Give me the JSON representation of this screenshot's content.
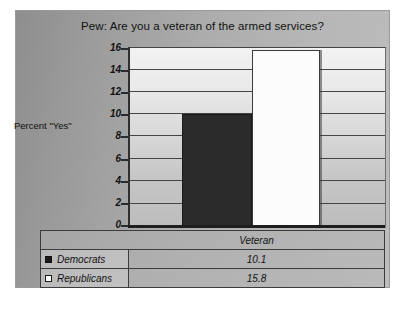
{
  "chart_data": {
    "type": "bar",
    "title": "Pew: Are you a veteran of the armed services?",
    "xlabel": "",
    "ylabel": "Percent \"Yes\"",
    "categories": [
      "Veteran"
    ],
    "series": [
      {
        "name": "Democrats",
        "values": [
          10.1
        ],
        "color": "#2b2b2b"
      },
      {
        "name": "Republicans",
        "values": [
          15.8
        ],
        "color": "#fcfcfc"
      }
    ],
    "ylim": [
      0,
      16
    ],
    "ytick_step": 2,
    "yticks": [
      "0",
      "2",
      "4",
      "6",
      "8",
      "10",
      "12",
      "14",
      "16"
    ],
    "grid": true,
    "legend_position": "table-below",
    "data_table": {
      "header": [
        "",
        "Veteran"
      ],
      "rows": [
        {
          "label": "Democrats",
          "marker": "filled-square",
          "values": [
            "10.1"
          ]
        },
        {
          "label": "Republicans",
          "marker": "open-square",
          "values": [
            "15.8"
          ]
        }
      ]
    }
  },
  "ticks": {
    "t16": "16",
    "t14": "14",
    "t12": "12",
    "t10": "10",
    "t8": "8",
    "t6": "6",
    "t4": "4",
    "t2": "2",
    "t0": "0"
  },
  "colors": {
    "democrat_bar": "#2b2b2b",
    "republican_bar": "#fcfcfc",
    "panel_background": "#acacac",
    "plot_background": "#dcdcdc",
    "axis": "#2b2b2b"
  }
}
